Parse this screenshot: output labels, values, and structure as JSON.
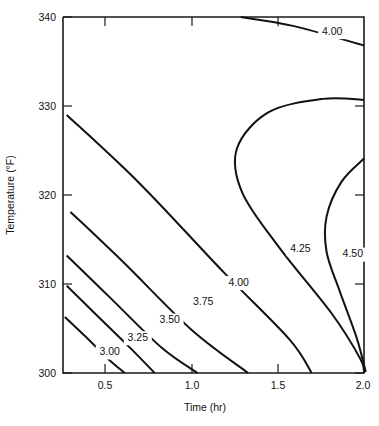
{
  "chart_data": {
    "type": "line",
    "subtype": "contour",
    "title": "",
    "xlabel": "Time (hr)",
    "ylabel": "Temperature (°F)",
    "xlim": [
      0.39,
      2.0
    ],
    "ylim": [
      298.5,
      340
    ],
    "xticks": [
      0.5,
      1.0,
      1.5,
      2.0
    ],
    "xtick_labels": [
      "0.5",
      "1.0",
      "1.5",
      "2.0"
    ],
    "yticks": [
      300,
      310,
      320,
      330,
      340
    ],
    "ytick_labels": [
      "300",
      "310",
      "320",
      "330",
      "340"
    ],
    "grid": false,
    "legend": "none",
    "contour_levels": [
      3.0,
      3.25,
      3.5,
      3.75,
      4.0,
      4.25,
      4.5
    ],
    "contour_labels": [
      "3.00",
      "3.25",
      "3.50",
      "3.75",
      "4.00",
      "4.25",
      "4.50"
    ],
    "contours": [
      {
        "level": 3.0,
        "label": "3.00",
        "label_xy": [
          0.64,
          302.3
        ],
        "points": [
          [
            0.4,
            306.3
          ],
          [
            0.52,
            303.9
          ],
          [
            0.63,
            301.6
          ],
          [
            0.72,
            300.0
          ]
        ]
      },
      {
        "level": 3.25,
        "label": "3.25",
        "label_xy": [
          0.79,
          303.9
        ],
        "points": [
          [
            0.41,
            309.8
          ],
          [
            0.58,
            306.3
          ],
          [
            0.76,
            302.6
          ],
          [
            0.88,
            300.0
          ]
        ]
      },
      {
        "level": 3.5,
        "label": "3.50",
        "label_xy": [
          0.96,
          305.9
        ],
        "points": [
          [
            0.41,
            313.2
          ],
          [
            0.65,
            308.3
          ],
          [
            0.92,
            302.8
          ],
          [
            1.11,
            300.0
          ]
        ]
      },
      {
        "level": 3.75,
        "label": "3.75",
        "label_xy": [
          1.14,
          308.0
        ],
        "points": [
          [
            0.43,
            318.1
          ],
          [
            0.72,
            312.3
          ],
          [
            1.08,
            304.8
          ],
          [
            1.38,
            300.0
          ]
        ]
      },
      {
        "level": 4.0,
        "label": "4.00",
        "label_xy": [
          1.33,
          310.1
        ],
        "points": [
          [
            0.41,
            329.0
          ],
          [
            0.8,
            321.3
          ],
          [
            1.25,
            311.3
          ],
          [
            1.6,
            303.8
          ],
          [
            1.72,
            300.0
          ]
        ]
      },
      {
        "level": 4.25,
        "label": "4.25",
        "label_xy": [
          1.66,
          313.9
        ],
        "points": [
          [
            2.0,
            330.7
          ],
          [
            1.78,
            330.8
          ],
          [
            1.49,
            329.3
          ],
          [
            1.32,
            325.2
          ],
          [
            1.35,
            320.2
          ],
          [
            1.55,
            314.0
          ],
          [
            1.83,
            306.6
          ],
          [
            1.98,
            301.6
          ],
          [
            2.0,
            300.0
          ]
        ]
      },
      {
        "level": 4.5,
        "label": "4.50",
        "label_xy": [
          1.94,
          313.3
        ],
        "points": [
          [
            2.0,
            324.1
          ],
          [
            1.88,
            321.5
          ],
          [
            1.8,
            317.6
          ],
          [
            1.8,
            313.6
          ],
          [
            1.87,
            309.2
          ],
          [
            1.96,
            304.0
          ],
          [
            2.01,
            300.1
          ]
        ]
      },
      {
        "level": 4.0,
        "label": "4.00",
        "label_xy": [
          1.83,
          338.3
        ],
        "label_id": "top",
        "points": [
          [
            1.34,
            340.0
          ],
          [
            1.62,
            339.0
          ],
          [
            2.0,
            336.8
          ]
        ]
      }
    ]
  }
}
